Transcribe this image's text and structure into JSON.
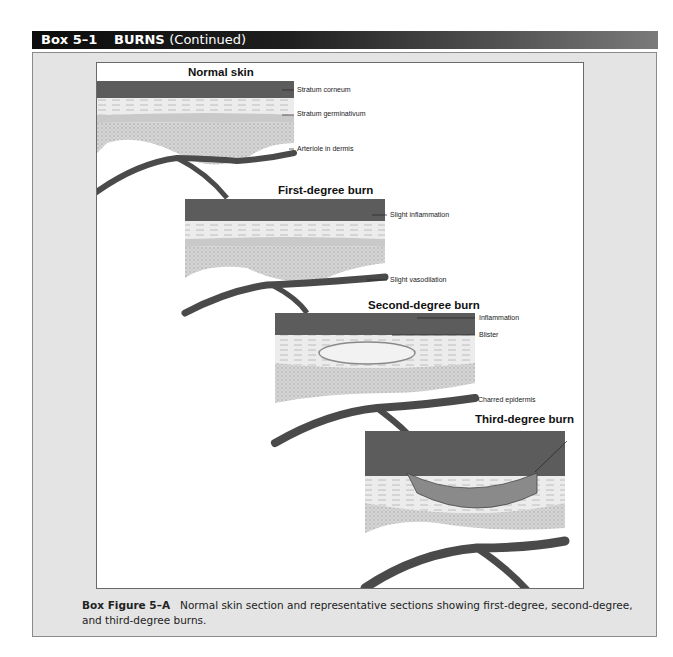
{
  "header": {
    "box_number": "Box 5–1",
    "title": "BURNS",
    "continued": "(Continued)"
  },
  "figure": {
    "panels": [
      {
        "title": "Normal skin",
        "labels": [
          "Stratum corneum",
          "Stratum germinativum",
          "Arteriole in dermis"
        ]
      },
      {
        "title": "First-degree burn",
        "labels": [
          "Slight inflammation",
          "Slight vasodilation"
        ]
      },
      {
        "title": "Second-degree burn",
        "labels": [
          "Inflammation",
          "Blister"
        ]
      },
      {
        "title": "Third-degree burn",
        "labels": [
          "Charred epidermis"
        ]
      }
    ]
  },
  "caption": {
    "label": "Box Figure 5–A",
    "text": "Normal skin section and representative sections showing first-degree, second-degree, and third-degree burns."
  },
  "colors": {
    "header_dark": "#0c0c0c",
    "box_bg": "#e4e4e4",
    "skin_surface": "#5c5c5c",
    "vessel": "#4a4a4a"
  }
}
